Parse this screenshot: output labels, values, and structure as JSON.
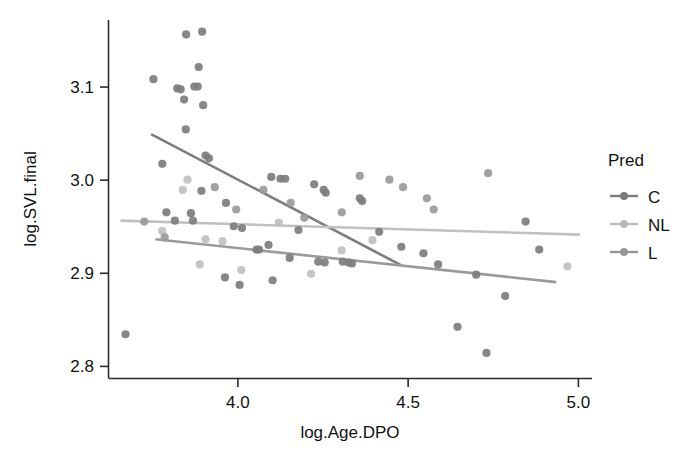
{
  "chart_data": {
    "type": "scatter",
    "title": "",
    "xlabel": "log.Age.DPO",
    "ylabel": "log.SVL.final",
    "xlim": [
      3.62,
      5.04
    ],
    "ylim": [
      2.787,
      3.172
    ],
    "xticks": [
      4.0,
      4.5,
      5.0
    ],
    "xtick_labels": [
      "4.0",
      "4.5",
      "5.0"
    ],
    "yticks": [
      2.8,
      2.9,
      3.0,
      3.1
    ],
    "ytick_labels": [
      "2.8",
      "2.9",
      "3.0",
      "3.1"
    ],
    "grid": false,
    "legend": {
      "title": "Pred",
      "position": "right",
      "entries": [
        {
          "name": "C",
          "color": "#7a7a7a"
        },
        {
          "name": "NL",
          "color": "#b8b8b8"
        },
        {
          "name": "L",
          "color": "#989898"
        }
      ]
    },
    "series": [
      {
        "name": "C",
        "color": "#7d7d7d",
        "marker": "circle",
        "fit_line": {
          "x": [
            3.745,
            4.48
          ],
          "y": [
            3.0495,
            2.9085
          ]
        },
        "points": [
          {
            "x": 3.848,
            "y": 3.1565
          },
          {
            "x": 3.895,
            "y": 3.1595
          },
          {
            "x": 3.885,
            "y": 3.1215
          },
          {
            "x": 3.752,
            "y": 3.1085
          },
          {
            "x": 3.822,
            "y": 3.0985
          },
          {
            "x": 3.832,
            "y": 3.0975
          },
          {
            "x": 3.872,
            "y": 3.1005
          },
          {
            "x": 3.882,
            "y": 3.1005
          },
          {
            "x": 3.842,
            "y": 3.0865
          },
          {
            "x": 3.898,
            "y": 3.0805
          },
          {
            "x": 3.847,
            "y": 3.0545
          },
          {
            "x": 3.905,
            "y": 3.0265
          },
          {
            "x": 3.915,
            "y": 3.0235
          },
          {
            "x": 3.778,
            "y": 3.0175
          },
          {
            "x": 3.893,
            "y": 2.9885
          },
          {
            "x": 3.965,
            "y": 2.9755
          },
          {
            "x": 4.098,
            "y": 3.0035
          },
          {
            "x": 4.125,
            "y": 3.0015
          },
          {
            "x": 4.139,
            "y": 3.0015
          },
          {
            "x": 4.224,
            "y": 2.9955
          },
          {
            "x": 4.252,
            "y": 2.9895
          },
          {
            "x": 4.258,
            "y": 2.9865
          },
          {
            "x": 4.358,
            "y": 2.9805
          },
          {
            "x": 4.365,
            "y": 2.9775
          },
          {
            "x": 4.48,
            "y": 2.9285
          },
          {
            "x": 3.79,
            "y": 2.9655
          },
          {
            "x": 3.815,
            "y": 2.9565
          },
          {
            "x": 3.862,
            "y": 2.9645
          },
          {
            "x": 3.868,
            "y": 2.9565
          },
          {
            "x": 3.988,
            "y": 2.9505
          },
          {
            "x": 4.012,
            "y": 2.9485
          },
          {
            "x": 4.178,
            "y": 2.9465
          },
          {
            "x": 4.055,
            "y": 2.9255
          },
          {
            "x": 4.062,
            "y": 2.9255
          },
          {
            "x": 4.09,
            "y": 2.9305
          },
          {
            "x": 4.152,
            "y": 2.9165
          },
          {
            "x": 4.236,
            "y": 2.9125
          },
          {
            "x": 4.255,
            "y": 2.9115
          },
          {
            "x": 4.308,
            "y": 2.9125
          },
          {
            "x": 4.325,
            "y": 2.9115
          },
          {
            "x": 4.335,
            "y": 2.9105
          },
          {
            "x": 4.415,
            "y": 2.9445
          },
          {
            "x": 4.545,
            "y": 2.9215
          },
          {
            "x": 4.588,
            "y": 2.9095
          },
          {
            "x": 4.7,
            "y": 2.8985
          },
          {
            "x": 4.785,
            "y": 2.8755
          },
          {
            "x": 4.885,
            "y": 2.9255
          },
          {
            "x": 4.845,
            "y": 2.9555
          },
          {
            "x": 4.645,
            "y": 2.8425
          },
          {
            "x": 4.73,
            "y": 2.8145
          },
          {
            "x": 3.962,
            "y": 2.8955
          },
          {
            "x": 4.005,
            "y": 2.8875
          },
          {
            "x": 4.102,
            "y": 2.8925
          },
          {
            "x": 3.67,
            "y": 2.8345
          }
        ]
      },
      {
        "name": "NL",
        "color": "#c0c0c0",
        "marker": "circle",
        "fit_line": {
          "x": [
            3.655,
            5.005
          ],
          "y": [
            2.9565,
            2.9415
          ]
        },
        "points": [
          {
            "x": 3.852,
            "y": 3.0005
          },
          {
            "x": 3.838,
            "y": 2.9895
          },
          {
            "x": 3.905,
            "y": 2.9365
          },
          {
            "x": 3.955,
            "y": 2.9345
          },
          {
            "x": 3.888,
            "y": 2.9095
          },
          {
            "x": 4.01,
            "y": 2.9035
          },
          {
            "x": 4.215,
            "y": 2.8995
          },
          {
            "x": 4.395,
            "y": 2.9355
          },
          {
            "x": 4.305,
            "y": 2.9245
          },
          {
            "x": 4.968,
            "y": 2.9075
          },
          {
            "x": 4.12,
            "y": 2.9545
          },
          {
            "x": 3.778,
            "y": 2.9455
          }
        ]
      },
      {
        "name": "L",
        "color": "#9a9a9a",
        "marker": "circle",
        "fit_line": {
          "x": [
            3.758,
            4.935
          ],
          "y": [
            2.9365,
            2.8905
          ]
        },
        "points": [
          {
            "x": 3.785,
            "y": 2.9385
          },
          {
            "x": 3.932,
            "y": 2.9925
          },
          {
            "x": 3.995,
            "y": 2.9685
          },
          {
            "x": 4.075,
            "y": 2.9895
          },
          {
            "x": 4.155,
            "y": 2.9755
          },
          {
            "x": 4.195,
            "y": 2.9595
          },
          {
            "x": 4.305,
            "y": 2.9655
          },
          {
            "x": 4.358,
            "y": 3.0045
          },
          {
            "x": 4.445,
            "y": 3.0005
          },
          {
            "x": 4.485,
            "y": 2.9925
          },
          {
            "x": 4.555,
            "y": 2.9805
          },
          {
            "x": 4.735,
            "y": 3.0075
          },
          {
            "x": 4.575,
            "y": 2.9685
          },
          {
            "x": 3.725,
            "y": 2.9555
          }
        ]
      }
    ]
  },
  "axes": {
    "x_title": "log.Age.DPO",
    "y_title": "log.SVL.final"
  },
  "legend": {
    "title": "Pred",
    "items": [
      {
        "label": "C"
      },
      {
        "label": "NL"
      },
      {
        "label": "L"
      }
    ]
  }
}
